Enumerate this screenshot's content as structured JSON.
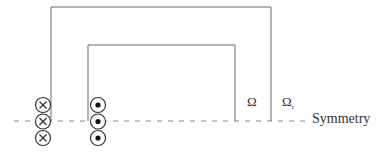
{
  "diagram": {
    "type": "electromagnetic-domain-schematic",
    "labels": {
      "inner_domain": "Ω",
      "outer_domain_base": "Ω",
      "outer_domain_sub": "r",
      "symmetry_line": "Symmetry"
    },
    "colors": {
      "lines": "#6a6a6a",
      "dashed": "#8a8a8a",
      "text": "#333333"
    },
    "conductors_into_page": {
      "symbol": "⊗",
      "count": 3
    },
    "conductors_out_of_page": {
      "symbol": "⊙",
      "count": 3
    }
  }
}
